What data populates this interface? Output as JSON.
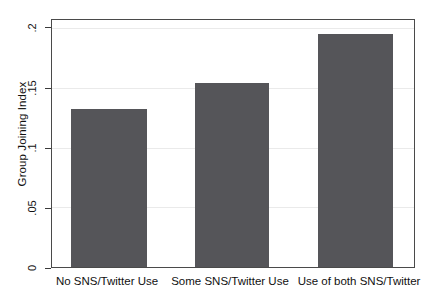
{
  "chart_data": {
    "type": "bar",
    "title": "",
    "subtitle": "",
    "xlabel": "",
    "ylabel": "Group Joining Index",
    "categories": [
      "No SNS/Twitter Use",
      "Some SNS/Twitter Use",
      "Use of both SNS/Twitter"
    ],
    "values": [
      0.132,
      0.154,
      0.195
    ],
    "ylim": [
      0,
      0.2
    ],
    "yticks": [
      0,
      0.05,
      0.1,
      0.15,
      0.2
    ],
    "ytick_labels": [
      "0",
      ".05",
      ".1",
      ".15",
      ".2"
    ],
    "grid": true,
    "legend": null,
    "legend_position": "none",
    "bar_color": "#555559",
    "frame_color": "#4a4a4a",
    "grid_color": "#eaeaea",
    "background_color": "#ffffff",
    "series": [
      {
        "name": "Group Joining Index",
        "values": [
          0.132,
          0.154,
          0.195
        ]
      }
    ]
  }
}
